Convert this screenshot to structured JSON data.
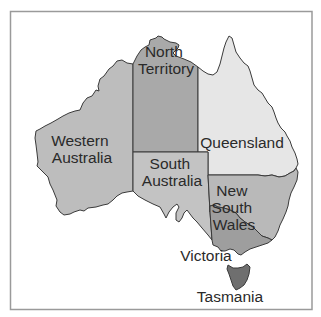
{
  "map": {
    "title": "Australia states and territories",
    "colors": {
      "western_australia": "#bdbdbd",
      "northern_territory": "#a9a9a9",
      "south_australia": "#c3c3c3",
      "queensland": "#e6e6e6",
      "new_south_wales": "#b9b9b9",
      "victoria": "#9e9e9e",
      "tasmania": "#6f6f6f",
      "frame": "#9a9a9a",
      "border": "#3a3a3a"
    },
    "regions": [
      {
        "id": "western_australia",
        "label_lines": [
          "Western",
          "Australia"
        ]
      },
      {
        "id": "northern_territory",
        "label_lines": [
          "North",
          "Territory"
        ]
      },
      {
        "id": "south_australia",
        "label_lines": [
          "South",
          "Australia"
        ]
      },
      {
        "id": "queensland",
        "label_lines": [
          "Queensland"
        ]
      },
      {
        "id": "new_south_wales",
        "label_lines": [
          "New",
          "South",
          "Wales"
        ]
      },
      {
        "id": "victoria",
        "label_lines": [
          "Victoria"
        ]
      },
      {
        "id": "tasmania",
        "label_lines": [
          "Tasmania"
        ]
      }
    ]
  }
}
